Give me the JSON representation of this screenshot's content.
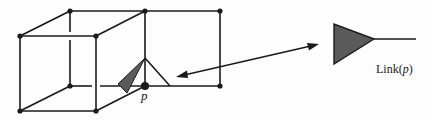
{
  "diagram": {
    "colors": {
      "stroke": "#1a1a1a",
      "fill_dark": "#5a5a5a",
      "background": "#fdfdfd"
    },
    "vertices": [
      {
        "id": "back-top-left",
        "x": 70,
        "y": 11
      },
      {
        "id": "back-top-mid",
        "x": 145,
        "y": 11
      },
      {
        "id": "back-top-right",
        "x": 220,
        "y": 11
      },
      {
        "id": "front-top-left",
        "x": 20,
        "y": 36
      },
      {
        "id": "front-top-right",
        "x": 96,
        "y": 36
      },
      {
        "id": "back-bottom-left",
        "x": 70,
        "y": 86
      },
      {
        "id": "p",
        "x": 145,
        "y": 86
      },
      {
        "id": "back-bottom-right",
        "x": 220,
        "y": 86
      },
      {
        "id": "front-bottom-left",
        "x": 20,
        "y": 111
      },
      {
        "id": "front-bottom-right",
        "x": 96,
        "y": 111
      }
    ],
    "labels": {
      "p": "p",
      "link_prefix": "Link(",
      "link_var": "p",
      "link_suffix": ")"
    }
  }
}
